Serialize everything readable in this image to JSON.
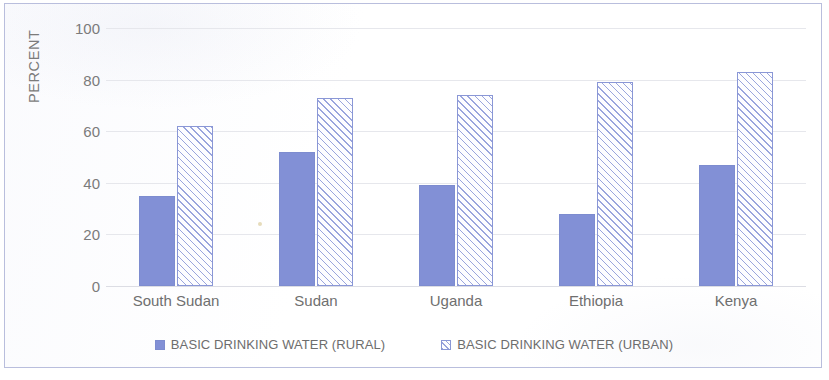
{
  "chart_data": {
    "type": "bar",
    "title": "",
    "xlabel": "",
    "ylabel": "PERCENT",
    "ylim": [
      0,
      100
    ],
    "yticks": [
      0,
      20,
      40,
      60,
      80,
      100
    ],
    "grid": true,
    "legend_position": "bottom",
    "categories": [
      "South Sudan",
      "Sudan",
      "Uganda",
      "Ethiopia",
      "Kenya"
    ],
    "series": [
      {
        "name": "BASIC DRINKING WATER (RURAL)",
        "pattern": "solid",
        "color": "#8290d6",
        "values": [
          35,
          52,
          39,
          28,
          47
        ]
      },
      {
        "name": "BASIC DRINKING WATER (URBAN)",
        "pattern": "diagonal-hatch",
        "color": "#9aa5dd",
        "values": [
          62,
          73,
          74,
          79,
          83
        ]
      }
    ]
  },
  "legend": {
    "items": [
      {
        "label": "BASIC DRINKING WATER (RURAL)",
        "swatch": "rural"
      },
      {
        "label": "BASIC DRINKING WATER (URBAN)",
        "swatch": "urban"
      }
    ]
  }
}
